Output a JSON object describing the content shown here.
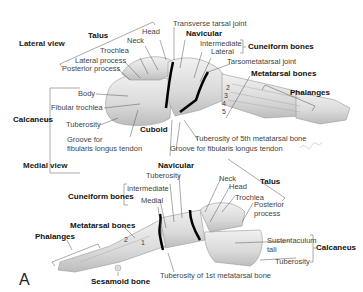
{
  "figure": {
    "panel_letter": "A",
    "signature": "F. Netter"
  },
  "lateral_view": {
    "title": "Lateral view",
    "talus": {
      "group_label": "Talus",
      "parts": [
        "Head",
        "Neck",
        "Trochlea",
        "Lateral process",
        "Posterior process"
      ]
    },
    "calcaneus": {
      "group_label": "Calcaneus",
      "parts": [
        "Body",
        "Fibular trochlea",
        "Tuberosity",
        "Groove for",
        "fibularis longus tendon"
      ]
    },
    "transverse_tarsal_joint": "Transverse tarsal joint",
    "navicular": "Navicular",
    "cuneiform": {
      "group_label": "Cuneiform bones",
      "parts": [
        "Intermediate",
        "Lateral"
      ]
    },
    "tarsometatarsal_joint": "Tarsometatarsal joint",
    "metatarsal_bones": "Metatarsal bones",
    "metatarsal_numbers": [
      "2",
      "3",
      "4",
      "5"
    ],
    "phalanges": "Phalanges",
    "cuboid": "Cuboid",
    "tuberosity_5th": "Tuberosity of 5th metatarsal bone",
    "groove_fibularis": "Groove for fibularis longus tendon"
  },
  "medial_view": {
    "title": "Medial view",
    "navicular": "Navicular",
    "navicular_tuberosity": "Tuberosity",
    "cuneiform": {
      "group_label": "Cuneiform bones",
      "parts": [
        "Intermediate",
        "Medial"
      ]
    },
    "metatarsal_bones": "Metatarsal bones",
    "metatarsal_numbers": [
      "2",
      "1"
    ],
    "phalanges": "Phalanges",
    "sesamoid": "Sesamoid bone",
    "tuberosity_1st": "Tuberosity of 1st metatarsal bone",
    "talus": {
      "group_label": "Talus",
      "parts": [
        "Neck",
        "Head",
        "Trochlea",
        "Posterior",
        "process"
      ]
    },
    "calcaneus": {
      "group_label": "Calcaneus",
      "parts": [
        "Sustentaculum",
        "tali",
        "Tuberosity"
      ]
    }
  }
}
